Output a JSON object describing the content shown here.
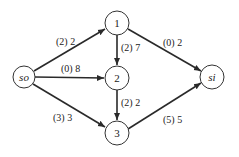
{
  "diagram": {
    "type": "flow-network",
    "nodes": [
      {
        "id": "so",
        "label": "so",
        "italic": true,
        "x": 24,
        "y": 77
      },
      {
        "id": "1",
        "label": "1",
        "italic": false,
        "x": 117,
        "y": 23
      },
      {
        "id": "2",
        "label": "2",
        "italic": false,
        "x": 117,
        "y": 78
      },
      {
        "id": "3",
        "label": "3",
        "italic": false,
        "x": 117,
        "y": 133
      },
      {
        "id": "si",
        "label": "si",
        "italic": true,
        "x": 212,
        "y": 77
      }
    ],
    "edges": [
      {
        "from": "so",
        "to": "1",
        "label": "(2) 2"
      },
      {
        "from": "so",
        "to": "2",
        "label": "(0) 8"
      },
      {
        "from": "so",
        "to": "3",
        "label": "(3) 3"
      },
      {
        "from": "1",
        "to": "2",
        "label": "(2) 7"
      },
      {
        "from": "1",
        "to": "si",
        "label": "(0) 2"
      },
      {
        "from": "2",
        "to": "3",
        "label": "(2) 2"
      },
      {
        "from": "3",
        "to": "si",
        "label": "(5) 5"
      }
    ]
  }
}
